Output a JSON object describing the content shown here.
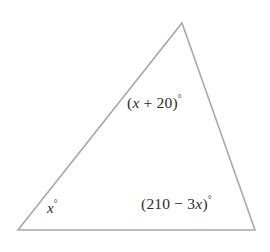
{
  "figure": {
    "type": "triangle-angle-diagram",
    "background_color": "#ffffff",
    "stroke_color": "#a9a9a9",
    "text_color": "#2b2b2b",
    "vertices": {
      "apex": {
        "x": 182,
        "y": 23
      },
      "bottom_left": {
        "x": 18,
        "y": 230
      },
      "bottom_right": {
        "x": 255,
        "y": 230
      }
    },
    "labels": {
      "apex_angle": {
        "full_text": "(x + 20)°",
        "prefix": "(",
        "variable": "x",
        "operator": " + ",
        "constant": "20",
        "suffix": ")",
        "degree": "°"
      },
      "bottom_right_angle": {
        "full_text": "(210 − 3x)°",
        "prefix": "(",
        "constant": "210",
        "operator": " − ",
        "coefficient": "3",
        "variable": "x",
        "suffix": ")",
        "degree": "°"
      },
      "bottom_left_angle": {
        "full_text": "x°",
        "variable": "x",
        "degree": "°"
      }
    }
  }
}
